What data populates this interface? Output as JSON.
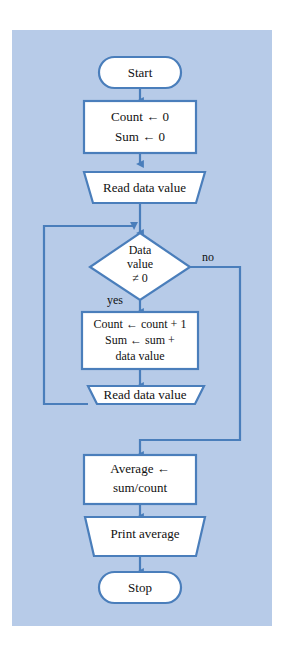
{
  "figure": {
    "kind": "flowchart",
    "panel_color": "#b7cbe8",
    "shape_fill": "#ffffff",
    "line_color": "#4a7ebb",
    "text_color": "#111111"
  },
  "nodes": {
    "start": {
      "shape": "terminator",
      "label": "Start"
    },
    "init": {
      "shape": "process",
      "line1": "Count ← 0",
      "line2": "Sum ← 0"
    },
    "read1": {
      "shape": "input-output",
      "label": "Read data value"
    },
    "decision": {
      "shape": "decision",
      "line1": "Data",
      "line2": "value",
      "line3": "≠ 0"
    },
    "accumulate": {
      "shape": "process",
      "line1": "Count ← count + 1",
      "line2": "Sum ← sum +",
      "line3": "data value"
    },
    "read2": {
      "shape": "input-output",
      "label": "Read data value"
    },
    "average": {
      "shape": "process",
      "line1": "Average ←",
      "line2": "sum/count"
    },
    "print": {
      "shape": "input-output",
      "label": "Print average"
    },
    "stop": {
      "shape": "terminator",
      "label": "Stop"
    }
  },
  "branch_labels": {
    "yes": "yes",
    "no": "no"
  }
}
